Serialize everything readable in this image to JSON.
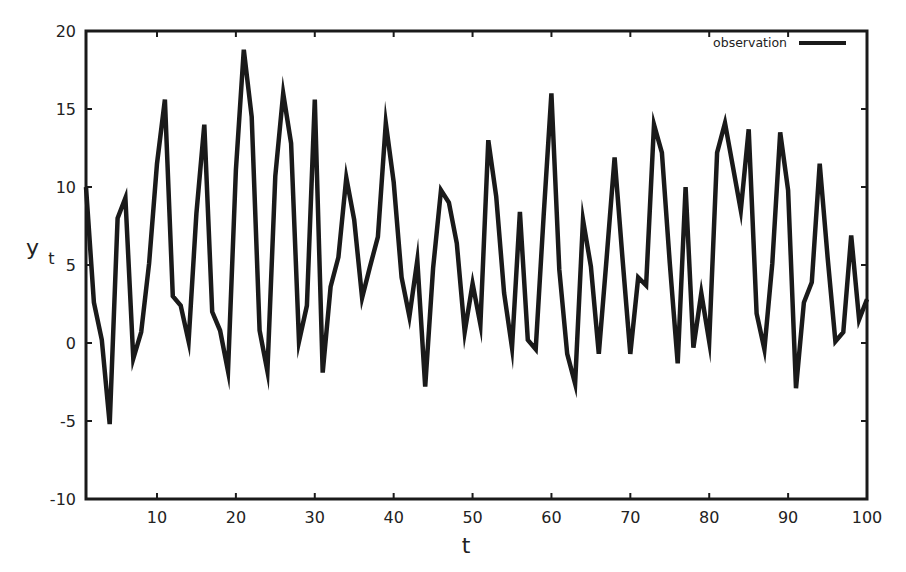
{
  "chart_data": {
    "type": "line",
    "title": "",
    "xlabel": "t",
    "ylabel": "y",
    "ylabel_subscript": "t",
    "xlim": [
      1,
      100
    ],
    "ylim": [
      -10,
      20
    ],
    "x_ticks": [
      10,
      20,
      30,
      40,
      50,
      60,
      70,
      80,
      90,
      100
    ],
    "x_tick_labels": [
      "10",
      "20",
      "30",
      "40",
      "50",
      "60",
      "70",
      "80",
      "90",
      "100"
    ],
    "y_ticks": [
      -10,
      -5,
      0,
      5,
      10,
      15,
      20
    ],
    "y_tick_labels": [
      "-10",
      "-5",
      "0",
      "5",
      "10",
      "15",
      "20"
    ],
    "grid": false,
    "legend_position": "top-right",
    "series": [
      {
        "name": "observation",
        "color": "#1a1a1a",
        "x": [
          1,
          2,
          3,
          4,
          5,
          6,
          7,
          8,
          9,
          10,
          11,
          12,
          13,
          14,
          15,
          16,
          17,
          18,
          19,
          20,
          21,
          22,
          23,
          24,
          25,
          26,
          27,
          28,
          29,
          30,
          31,
          32,
          33,
          34,
          35,
          36,
          37,
          38,
          39,
          40,
          41,
          42,
          43,
          44,
          45,
          46,
          47,
          48,
          49,
          50,
          51,
          52,
          53,
          54,
          55,
          56,
          57,
          58,
          59,
          60,
          61,
          62,
          63,
          64,
          65,
          66,
          67,
          68,
          69,
          70,
          71,
          72,
          73,
          74,
          75,
          76,
          77,
          78,
          79,
          80,
          81,
          82,
          83,
          84,
          85,
          86,
          87,
          88,
          89,
          90,
          91,
          92,
          93,
          94,
          95,
          96,
          97,
          98,
          99,
          100
        ],
        "values": [
          10.0,
          2.6,
          0.2,
          -5.2,
          8.0,
          9.3,
          -1.0,
          0.7,
          5.1,
          11.5,
          15.6,
          3.0,
          2.4,
          0.1,
          8.3,
          14.0,
          2.0,
          0.8,
          -1.8,
          11.1,
          18.8,
          14.5,
          0.8,
          -1.8,
          10.7,
          16.0,
          12.8,
          0.1,
          2.4,
          15.6,
          -1.9,
          3.6,
          5.5,
          10.6,
          7.9,
          2.9,
          4.9,
          6.8,
          14.1,
          10.3,
          4.2,
          1.7,
          5.3,
          -2.8,
          4.8,
          9.8,
          9.0,
          6.4,
          0.7,
          3.8,
          1.2,
          13.0,
          9.4,
          3.2,
          -0.3,
          8.4,
          0.2,
          -0.4,
          8.1,
          16.0,
          4.7,
          -0.7,
          -2.6,
          7.9,
          4.9,
          -0.7,
          5.5,
          11.9,
          5.5,
          -0.7,
          4.2,
          3.7,
          14.0,
          12.2,
          5.1,
          -1.3,
          10.0,
          -0.3,
          3.2,
          0.1,
          12.2,
          14.1,
          11.3,
          8.5,
          13.7,
          1.9,
          -0.4,
          5.1,
          13.5,
          9.8,
          -2.9,
          2.6,
          3.9,
          11.5,
          5.5,
          0.1,
          0.7,
          6.9,
          1.5,
          2.8
        ]
      }
    ]
  },
  "legend": {
    "items": [
      {
        "label": "observation"
      }
    ]
  },
  "axes": {
    "x_title": "t",
    "y_title": "y",
    "y_title_sub": "t"
  }
}
